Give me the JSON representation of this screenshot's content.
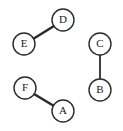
{
  "diagram": {
    "type": "undirected-graph",
    "title": "",
    "background_color": "#ffffff",
    "node_fill_color": "#ffffff",
    "node_stroke_color": "#2b2b2b",
    "edge_color": "#2b2b2b",
    "label_color": "#1a1a1a",
    "node_radius": 11,
    "node_stroke_width": 1.4,
    "nodes": [
      {
        "id": "D",
        "label": "D",
        "cx": 63,
        "cy": 20
      },
      {
        "id": "E",
        "label": "E",
        "cx": 24,
        "cy": 44
      },
      {
        "id": "C",
        "label": "C",
        "cx": 100,
        "cy": 44
      },
      {
        "id": "B",
        "label": "B",
        "cx": 100,
        "cy": 90
      },
      {
        "id": "F",
        "label": "F",
        "cx": 25,
        "cy": 88
      },
      {
        "id": "A",
        "label": "A",
        "cx": 63,
        "cy": 111
      }
    ],
    "edges": [
      {
        "id": "E-D",
        "source": "E",
        "target": "D",
        "x1": 33,
        "y1": 39,
        "x2": 54,
        "y2": 26,
        "width": 2.6
      },
      {
        "id": "C-B",
        "source": "C",
        "target": "B",
        "x1": 100,
        "y1": 55,
        "x2": 100,
        "y2": 79,
        "width": 1.8
      },
      {
        "id": "F-A",
        "source": "F",
        "target": "A",
        "x1": 34,
        "y1": 94,
        "x2": 54,
        "y2": 106,
        "width": 2.6
      }
    ],
    "components": [
      {
        "id": "component-1",
        "members": [
          "E",
          "D"
        ]
      },
      {
        "id": "component-2",
        "members": [
          "C",
          "B"
        ]
      },
      {
        "id": "component-3",
        "members": [
          "F",
          "A"
        ]
      }
    ]
  }
}
